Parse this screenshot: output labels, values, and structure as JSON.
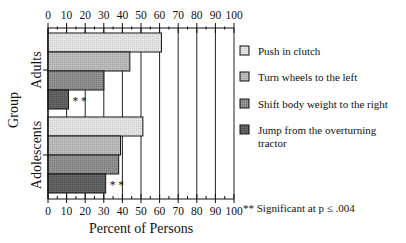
{
  "chart_data": {
    "type": "bar",
    "orientation": "horizontal",
    "title": "",
    "xlabel": "Percent of Persons",
    "ylabel": "Group",
    "xlim": [
      0,
      100
    ],
    "x_ticks": [
      0,
      10,
      20,
      30,
      40,
      50,
      60,
      70,
      80,
      90,
      100
    ],
    "x_tick_labels": [
      "0",
      "10",
      "20",
      "30",
      "40",
      "50",
      "60",
      "70",
      "80",
      "90",
      "100"
    ],
    "grid": "vertical",
    "categories": [
      "Adults",
      "Adolescents"
    ],
    "series": [
      {
        "name": "Push in clutch",
        "values": [
          61,
          51
        ],
        "color": "#e4e4e4"
      },
      {
        "name": "Turn wheels to the left",
        "values": [
          44,
          39
        ],
        "color": "#bababa"
      },
      {
        "name": "Shift body weight to the right",
        "values": [
          30,
          38
        ],
        "color": "#8c8c8c"
      },
      {
        "name": "Jump from the overturning tractor",
        "values": [
          11,
          31
        ],
        "color": "#5c5c5c"
      }
    ],
    "annotations": [
      {
        "category": "Adults",
        "series": "Jump from the overturning tractor",
        "text": "**"
      },
      {
        "category": "Adolescents",
        "series": "Jump from the overturning tractor",
        "text": "**"
      }
    ],
    "footnote": "** Significant at p ≤ .004",
    "legend_position": "right"
  },
  "legend": {
    "items": [
      {
        "label": "Push in clutch"
      },
      {
        "label": "Turn wheels to the left"
      },
      {
        "label": "Shift body weight to the right"
      },
      {
        "label": "Jump from the overturning",
        "label_line2": "tractor"
      }
    ],
    "footnote": "** Significant at p ≤ .004"
  },
  "axes": {
    "x_title": "Percent of Persons",
    "y_title": "Group",
    "groups": [
      "Adults",
      "Adolescents"
    ],
    "significance_marker": "* *"
  }
}
